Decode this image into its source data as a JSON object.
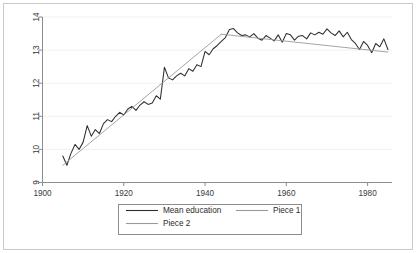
{
  "chart_data": {
    "type": "line",
    "title": "",
    "xlabel": "",
    "ylabel": "",
    "xlim": [
      1900,
      1986
    ],
    "ylim": [
      9,
      14
    ],
    "xticks": [
      1900,
      1920,
      1940,
      1960,
      1980
    ],
    "yticks": [
      9,
      10,
      11,
      12,
      13,
      14
    ],
    "grid": "horizontal",
    "legend_position": "below-plot",
    "series": [
      {
        "name": "Mean education",
        "color": "#2f2f2f",
        "x": [
          1905,
          1906,
          1907,
          1908,
          1909,
          1910,
          1911,
          1912,
          1913,
          1914,
          1915,
          1916,
          1917,
          1918,
          1919,
          1920,
          1921,
          1922,
          1923,
          1924,
          1925,
          1926,
          1927,
          1928,
          1929,
          1930,
          1931,
          1932,
          1933,
          1934,
          1935,
          1936,
          1937,
          1938,
          1939,
          1940,
          1941,
          1942,
          1943,
          1944,
          1945,
          1946,
          1947,
          1948,
          1949,
          1950,
          1951,
          1952,
          1953,
          1954,
          1955,
          1956,
          1957,
          1958,
          1959,
          1960,
          1961,
          1962,
          1963,
          1964,
          1965,
          1966,
          1967,
          1968,
          1969,
          1970,
          1971,
          1972,
          1973,
          1974,
          1975,
          1976,
          1977,
          1978,
          1979,
          1980,
          1981,
          1982,
          1983,
          1984,
          1985
        ],
        "values": [
          9.8,
          9.52,
          9.88,
          10.15,
          10.0,
          10.22,
          10.72,
          10.4,
          10.6,
          10.48,
          10.78,
          10.9,
          10.84,
          11.0,
          11.12,
          11.04,
          11.22,
          11.3,
          11.18,
          11.34,
          11.44,
          11.36,
          11.4,
          11.62,
          11.52,
          12.48,
          12.16,
          12.1,
          12.22,
          12.3,
          12.22,
          12.44,
          12.36,
          12.56,
          12.5,
          12.96,
          12.86,
          13.04,
          13.14,
          13.26,
          13.38,
          13.62,
          13.65,
          13.52,
          13.44,
          13.46,
          13.4,
          13.5,
          13.36,
          13.3,
          13.44,
          13.36,
          13.28,
          13.46,
          13.24,
          13.5,
          13.46,
          13.3,
          13.42,
          13.44,
          13.34,
          13.52,
          13.46,
          13.54,
          13.48,
          13.64,
          13.52,
          13.44,
          13.58,
          13.4,
          13.54,
          13.32,
          13.2,
          13.02,
          13.26,
          13.14,
          12.92,
          13.2,
          13.1,
          13.34,
          13.02
        ]
      },
      {
        "name": "Piece 1",
        "color": "#9a9a9a",
        "x": [
          1905,
          1944
        ],
        "values": [
          9.52,
          13.48
        ]
      },
      {
        "name": "Piece 2",
        "color": "#9a9a9a",
        "x": [
          1944,
          1985
        ],
        "values": [
          13.48,
          12.94
        ]
      }
    ]
  },
  "legend": {
    "entries": [
      {
        "label": "Mean education",
        "color": "#2f2f2f"
      },
      {
        "label": "Piece 1",
        "color": "#9a9a9a"
      },
      {
        "label": "Piece 2",
        "color": "#9a9a9a"
      }
    ]
  },
  "axes": {
    "x_tick_labels": [
      "1900",
      "1920",
      "1940",
      "1960",
      "1980"
    ],
    "y_tick_labels": [
      "9",
      "10",
      "11",
      "12",
      "13",
      "14"
    ]
  },
  "colors": {
    "series_primary": "#2f2f2f",
    "series_fit": "#9a9a9a",
    "axis": "#8c8c8c",
    "grid": "#f0f0f0",
    "frame": "#c9c9c9",
    "background": "#ffffff"
  }
}
